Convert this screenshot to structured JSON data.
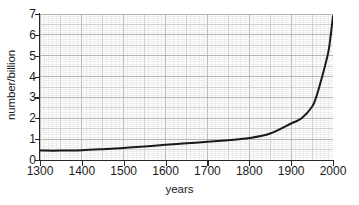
{
  "chart_data": {
    "type": "line",
    "title": "",
    "subtitle": "",
    "xlabel": "years",
    "ylabel": "number/billion",
    "xlim": [
      1300,
      2000
    ],
    "ylim": [
      0,
      7
    ],
    "x_ticks": [
      1300,
      1400,
      1500,
      1600,
      1700,
      1800,
      1900,
      2000
    ],
    "x_tick_labels": [
      "1300",
      "1400",
      "1500",
      "1600",
      "1700",
      "1800",
      "1900",
      "2000"
    ],
    "y_ticks": [
      0,
      1,
      2,
      3,
      4,
      5,
      6,
      7
    ],
    "y_tick_labels": [
      "0",
      "1",
      "2",
      "3",
      "4",
      "5",
      "6",
      "7"
    ],
    "grid": true,
    "grid_minor": true,
    "grid_major_step_x": 50,
    "grid_minor_step_x": 10,
    "grid_major_step_y": 0.5,
    "grid_minor_step_y": 0.1,
    "legend": false,
    "legend_position": "none",
    "annotations": [],
    "series": [
      {
        "name": "world population",
        "color": "#1a1a1a",
        "line_width": 2.0,
        "x": [
          1300,
          1350,
          1400,
          1450,
          1500,
          1550,
          1600,
          1650,
          1700,
          1750,
          1800,
          1850,
          1900,
          1925,
          1950,
          1960,
          1970,
          1980,
          1990,
          2000
        ],
        "values": [
          0.45,
          0.45,
          0.47,
          0.52,
          0.58,
          0.65,
          0.73,
          0.8,
          0.87,
          0.95,
          1.05,
          1.27,
          1.75,
          2.0,
          2.55,
          3.03,
          3.7,
          4.45,
          5.3,
          6.9
        ]
      }
    ]
  },
  "axes": {
    "y_title": "number/billion",
    "x_title": "years"
  }
}
